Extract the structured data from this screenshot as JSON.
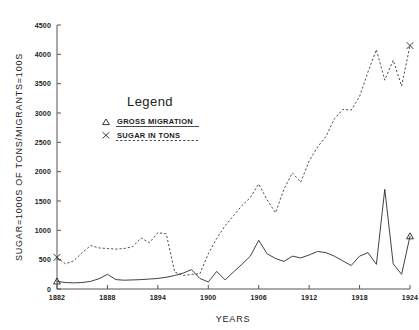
{
  "chart_data": {
    "type": "line",
    "title": "",
    "xlabel": "YEARS",
    "ylabel": "SUGAR=1000S OF TONS/MIGRANTS=100S",
    "xlim": [
      1882,
      1924
    ],
    "ylim": [
      0,
      4500
    ],
    "xticks": [
      1882,
      1888,
      1894,
      1900,
      1906,
      1912,
      1918,
      1924
    ],
    "yticks": [
      0,
      500,
      1000,
      1500,
      2000,
      2500,
      3000,
      3500,
      4000,
      4500
    ],
    "grid": false,
    "legend": {
      "title": "Legend",
      "position": "upper-left-inside",
      "entries": [
        {
          "marker": "triangle",
          "label": "GROSS MIGRATION",
          "style": "solid"
        },
        {
          "marker": "x",
          "label": "SUGAR IN TONS",
          "style": "dashed"
        }
      ]
    },
    "x": [
      1882,
      1883,
      1884,
      1885,
      1886,
      1887,
      1888,
      1889,
      1890,
      1891,
      1892,
      1893,
      1894,
      1895,
      1896,
      1897,
      1898,
      1899,
      1900,
      1901,
      1902,
      1903,
      1904,
      1905,
      1906,
      1907,
      1908,
      1909,
      1910,
      1911,
      1912,
      1913,
      1914,
      1915,
      1916,
      1917,
      1918,
      1919,
      1920,
      1921,
      1922,
      1923,
      1924
    ],
    "series": [
      {
        "name": "SUGAR IN TONS",
        "style": "dashed",
        "marker": "x",
        "marker_points": [
          {
            "x": 1882,
            "y": 540
          },
          {
            "x": 1924,
            "y": 4150
          }
        ],
        "values": [
          540,
          430,
          480,
          620,
          740,
          700,
          690,
          680,
          690,
          720,
          870,
          790,
          960,
          940,
          290,
          230,
          250,
          260,
          600,
          860,
          1080,
          1250,
          1420,
          1560,
          1790,
          1520,
          1300,
          1700,
          1980,
          1820,
          2180,
          2420,
          2600,
          2900,
          3060,
          3050,
          3280,
          3700,
          4080,
          3560,
          3900,
          3460,
          4150
        ]
      },
      {
        "name": "GROSS MIGRATION",
        "style": "solid",
        "marker": "triangle",
        "marker_points": [
          {
            "x": 1882,
            "y": 130
          },
          {
            "x": 1924,
            "y": 900
          }
        ],
        "values": [
          130,
          110,
          105,
          110,
          130,
          175,
          250,
          160,
          150,
          155,
          160,
          170,
          180,
          200,
          230,
          270,
          330,
          180,
          120,
          300,
          155,
          290,
          420,
          560,
          830,
          600,
          520,
          470,
          560,
          530,
          580,
          640,
          620,
          560,
          480,
          400,
          560,
          620,
          420,
          1700,
          430,
          250,
          900
        ]
      }
    ],
    "annotations": []
  }
}
